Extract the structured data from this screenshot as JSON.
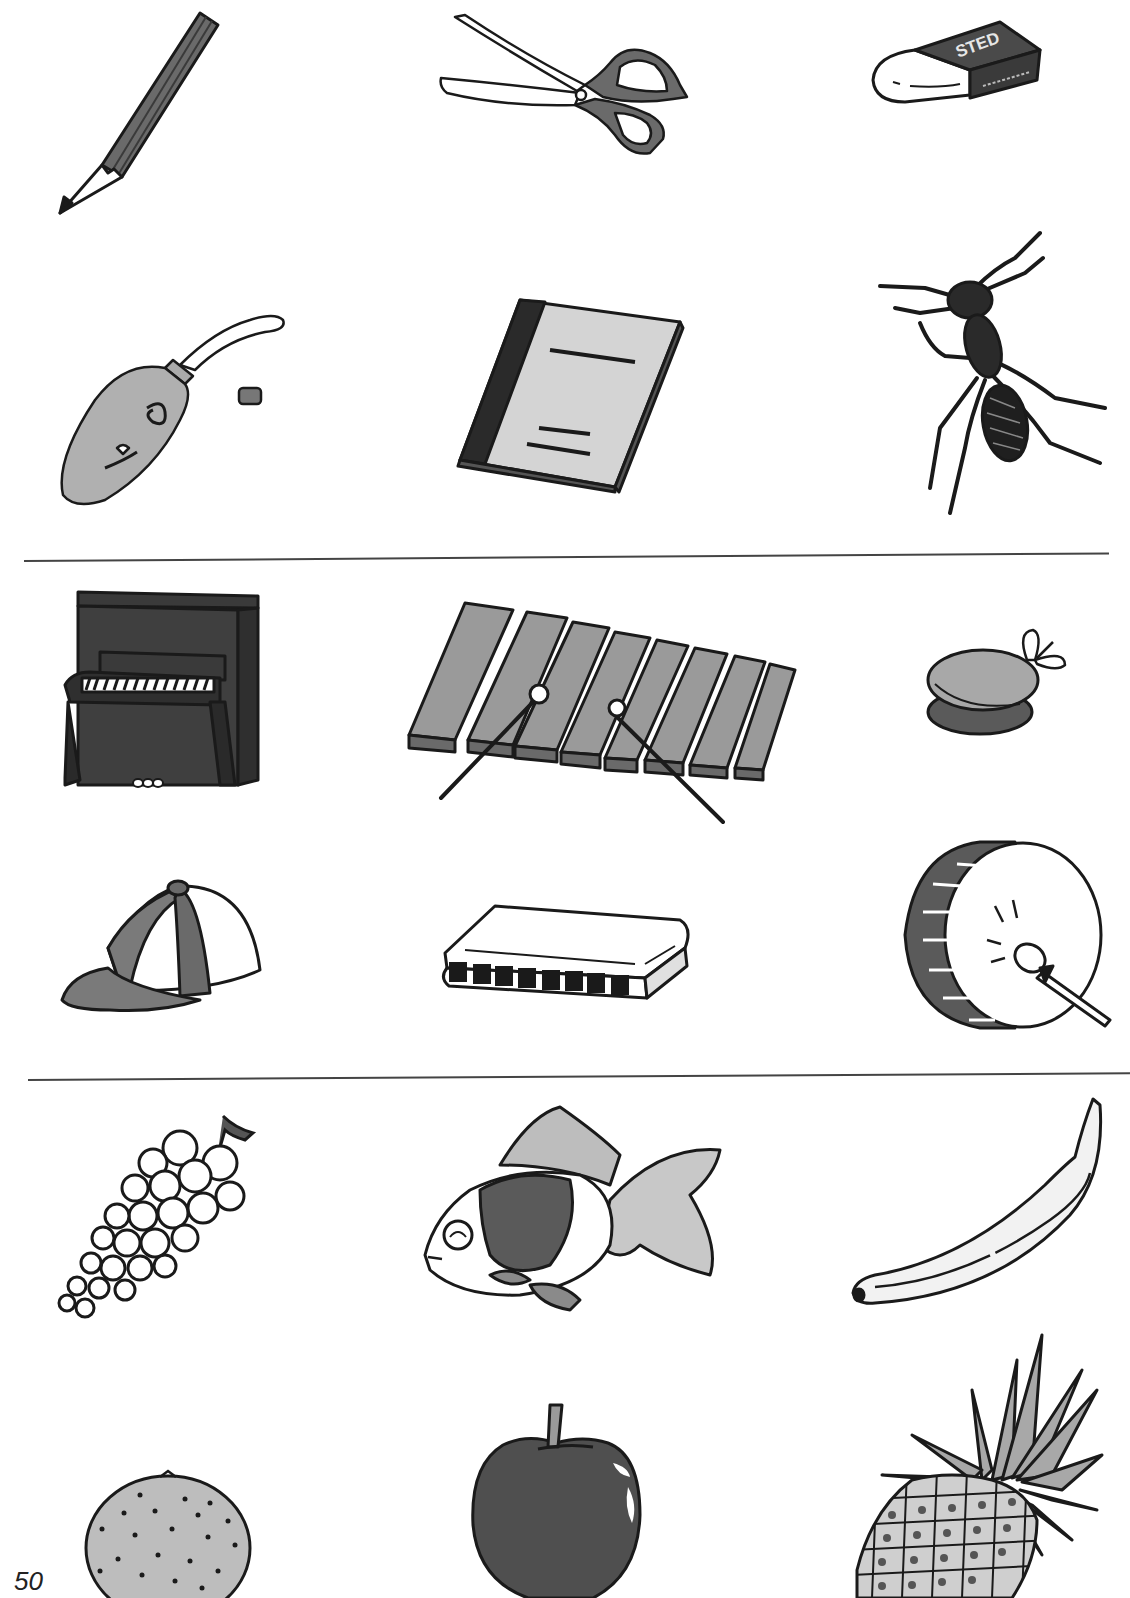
{
  "page": {
    "page_number": "50",
    "colors": {
      "ink": "#1a1a1a",
      "dark_fill": "#4a4a4a",
      "mid_fill": "#8a8a8a",
      "light_fill": "#bdbdbd",
      "paper": "#ffffff",
      "rule": "#444444"
    }
  },
  "groups": [
    {
      "name": "school-supplies-and-ant",
      "items": [
        {
          "label": "pencil"
        },
        {
          "label": "scissors"
        },
        {
          "label": "eraser",
          "brand_text": "STED"
        },
        {
          "label": "glue tube"
        },
        {
          "label": "notebook"
        },
        {
          "label": "ant"
        }
      ]
    },
    {
      "name": "musical-instruments-and-cap",
      "items": [
        {
          "label": "piano"
        },
        {
          "label": "xylophone"
        },
        {
          "label": "castanets"
        },
        {
          "label": "cap"
        },
        {
          "label": "harmonica"
        },
        {
          "label": "drum"
        }
      ]
    },
    {
      "name": "fruits-and-goldfish",
      "items": [
        {
          "label": "grapes"
        },
        {
          "label": "goldfish"
        },
        {
          "label": "banana"
        },
        {
          "label": "orange"
        },
        {
          "label": "apple"
        },
        {
          "label": "pineapple"
        }
      ]
    }
  ]
}
